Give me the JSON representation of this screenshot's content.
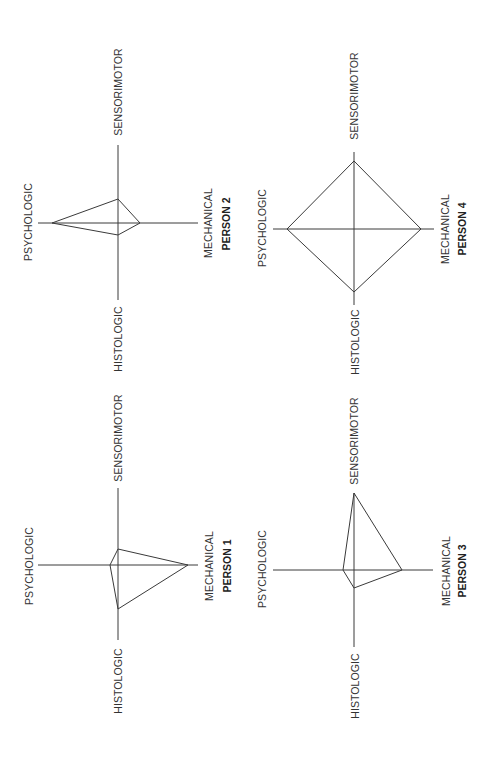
{
  "figure": {
    "orientation": "rotated-90-ccw",
    "axis_labels": {
      "top": "SENSORIMOTOR",
      "left": "PSYCHOLOGIC",
      "right": "MECHANICAL",
      "bottom": "HISTOLOGIC"
    },
    "colors": {
      "line": "#3a3a3a",
      "text": "#333333",
      "background": "#ffffff"
    }
  },
  "diagrams": [
    {
      "id": "person-2",
      "title": "PERSON 2",
      "center": [
        118,
        223
      ],
      "axis_extent": {
        "top": 145,
        "bottom": 300,
        "left": 38,
        "right": 198
      },
      "points": {
        "sensorimotor": [
          118,
          199
        ],
        "mechanical": [
          140,
          223
        ],
        "histologic": [
          118,
          235
        ],
        "psychologic": [
          52,
          223
        ]
      },
      "labels": {
        "sensorimotor": {
          "text": "SENSORIMOTOR",
          "x": 122,
          "y": 92
        },
        "psychologic": {
          "text": "PSYCHOLOGIC",
          "x": 32,
          "y": 222
        },
        "mechanical": {
          "text": "MECHANICAL",
          "x": 212,
          "y": 223
        },
        "person": {
          "text": "PERSON 2",
          "x": 230,
          "y": 224
        },
        "histologic": {
          "text": "HISTOLOGIC",
          "x": 122,
          "y": 339
        }
      }
    },
    {
      "id": "person-4",
      "title": "PERSON 4",
      "center": [
        354,
        229
      ],
      "axis_extent": {
        "top": 152,
        "bottom": 305,
        "left": 273,
        "right": 434
      },
      "points": {
        "sensorimotor": [
          354,
          161
        ],
        "mechanical": [
          421,
          229
        ],
        "histologic": [
          354,
          292
        ],
        "psychologic": [
          287,
          229
        ]
      },
      "labels": {
        "sensorimotor": {
          "text": "SENSORIMOTOR",
          "x": 358,
          "y": 96
        },
        "psychologic": {
          "text": "PSYCHOLOGIC",
          "x": 266,
          "y": 228
        },
        "mechanical": {
          "text": "MECHANICAL",
          "x": 449,
          "y": 229
        },
        "person": {
          "text": "PERSON 4",
          "x": 466,
          "y": 229
        },
        "histologic": {
          "text": "HISTOLOGIC",
          "x": 359,
          "y": 342
        }
      }
    },
    {
      "id": "person-1",
      "title": "PERSON 1",
      "center": [
        118,
        565
      ],
      "axis_extent": {
        "top": 488,
        "bottom": 640,
        "left": 38,
        "right": 198
      },
      "points": {
        "sensorimotor": [
          118,
          549
        ],
        "mechanical": [
          188,
          565
        ],
        "histologic": [
          118,
          609
        ],
        "psychologic": [
          110,
          565
        ]
      },
      "labels": {
        "sensorimotor": {
          "text": "SENSORIMOTOR",
          "x": 122,
          "y": 438
        },
        "psychologic": {
          "text": "PSYCHOLOGIC",
          "x": 33,
          "y": 566
        },
        "mechanical": {
          "text": "MECHANICAL",
          "x": 213,
          "y": 566
        },
        "person": {
          "text": "PERSON 1",
          "x": 231,
          "y": 566
        },
        "histologic": {
          "text": "HISTOLOGIC",
          "x": 122,
          "y": 681
        }
      }
    },
    {
      "id": "person-3",
      "title": "PERSON 3",
      "center": [
        354,
        570
      ],
      "axis_extent": {
        "top": 493,
        "bottom": 647,
        "left": 273,
        "right": 433
      },
      "points": {
        "sensorimotor": [
          354,
          493
        ],
        "mechanical": [
          402,
          570
        ],
        "histologic": [
          354,
          588
        ],
        "psychologic": [
          343,
          570
        ]
      },
      "labels": {
        "sensorimotor": {
          "text": "SENSORIMOTOR",
          "x": 358,
          "y": 441
        },
        "psychologic": {
          "text": "PSYCHOLOGIC",
          "x": 266,
          "y": 569
        },
        "mechanical": {
          "text": "MECHANICAL",
          "x": 450,
          "y": 571
        },
        "person": {
          "text": "PERSON 3",
          "x": 466,
          "y": 571
        },
        "histologic": {
          "text": "HISTOLOGIC",
          "x": 359,
          "y": 686
        }
      }
    }
  ]
}
